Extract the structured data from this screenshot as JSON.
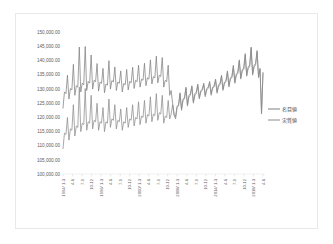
{
  "chart_data": {
    "type": "line",
    "title": "",
    "xlabel": "",
    "ylabel": "",
    "ylim": [
      100000,
      150000
    ],
    "ytick_step": 5000,
    "grid": "baseline-only",
    "legend_position": "right",
    "ytick_labels": [
      "150,000.00",
      "145,000.00",
      "140,000.00",
      "135,000.00",
      "130,000.00",
      "125,000.00",
      "120,000.00",
      "115,000.00",
      "110,000.00",
      "105,000.00",
      "100,000.00"
    ],
    "ytick_values": [
      150000,
      145000,
      140000,
      135000,
      130000,
      125000,
      120000,
      115000,
      110000,
      105000,
      100000
    ],
    "xtick_labels": [
      "1994/ 1-3",
      "4-6",
      "7-9",
      "10-12",
      "1996/ 1-3",
      "4-6",
      "7-9",
      "10-12",
      "2000/ 1-3",
      "4-6",
      "7-9",
      "10-12",
      "2008/ 1-3",
      "4-6",
      "7-9",
      "10-12",
      "2014/ 1-3",
      "4-6",
      "7-9",
      "10-12",
      "2018/ 1-3",
      "4-6"
    ],
    "series": [
      {
        "name": "名目値",
        "color": "#808080",
        "values": [
          123200,
          128900,
          128300,
          134800,
          126400,
          130100,
          129600,
          138600,
          127700,
          131100,
          130600,
          144700,
          128900,
          132000,
          131400,
          144900,
          129400,
          132600,
          132000,
          141900,
          129900,
          133000,
          132500,
          138900,
          129200,
          132400,
          131900,
          137200,
          128600,
          131700,
          131300,
          139900,
          129900,
          132900,
          132400,
          137700,
          129400,
          132400,
          131900,
          136300,
          128900,
          131900,
          131400,
          136800,
          129600,
          132600,
          132100,
          137600,
          130100,
          133000,
          132500,
          138300,
          130600,
          133400,
          133000,
          139000,
          131100,
          133900,
          133400,
          140200,
          131700,
          134300,
          133900,
          141500,
          132100,
          134800,
          134300,
          141000,
          130600,
          133000,
          132500,
          138300,
          127700,
          129400,
          124900,
          121100,
          120100,
          123900,
          124400,
          128600,
          122900,
          126400,
          126900,
          130600,
          124400,
          127700,
          128300,
          131100,
          125400,
          128300,
          128900,
          131700,
          126900,
          129400,
          129900,
          132000,
          127700,
          130100,
          130600,
          132600,
          128300,
          130600,
          131100,
          133400,
          128900,
          131400,
          131900,
          134800,
          129900,
          132400,
          132900,
          136300,
          131100,
          133900,
          134300,
          138300,
          132400,
          135300,
          135800,
          140200,
          133900,
          136800,
          137200,
          142400,
          134900,
          137700,
          138300,
          144700,
          135300,
          138300,
          138900,
          143500,
          134300,
          137200,
          121600,
          135800
        ]
      },
      {
        "name": "実質値",
        "color": "#8c8c8c",
        "values": [
          108900,
          114400,
          113900,
          119900,
          111900,
          115900,
          115400,
          124400,
          113400,
          116900,
          116400,
          130600,
          114900,
          117900,
          117400,
          130100,
          115400,
          118400,
          117900,
          127700,
          115900,
          118900,
          118400,
          124900,
          115400,
          118400,
          117900,
          123400,
          114900,
          118400,
          117900,
          126400,
          116400,
          119400,
          118900,
          124400,
          115900,
          118900,
          118400,
          122900,
          115400,
          118400,
          117900,
          123400,
          116400,
          119400,
          118900,
          124400,
          116900,
          119900,
          119400,
          125400,
          117400,
          120400,
          119900,
          125900,
          117900,
          120900,
          120400,
          127200,
          118400,
          121100,
          120600,
          128300,
          118900,
          121600,
          121100,
          127700,
          117900,
          120400,
          119900,
          125900,
          119400,
          121100,
          124400,
          120600,
          119400,
          123400,
          123900,
          128100,
          122400,
          125900,
          126400,
          130100,
          123900,
          127200,
          127700,
          130600,
          124900,
          127700,
          128300,
          131100,
          126400,
          128900,
          129400,
          131400,
          127200,
          129600,
          130100,
          132000,
          127700,
          130100,
          130600,
          132900,
          128400,
          130900,
          131400,
          134300,
          129400,
          131900,
          132400,
          135800,
          130600,
          133400,
          133900,
          137700,
          131900,
          134800,
          135300,
          139700,
          133400,
          136300,
          136800,
          141900,
          134400,
          137200,
          137700,
          144200,
          134800,
          137700,
          138300,
          142900,
          133900,
          136800,
          121100,
          135300
        ]
      }
    ]
  },
  "legend": {
    "items": [
      {
        "label": "名目値"
      },
      {
        "label": "実質値"
      }
    ]
  }
}
